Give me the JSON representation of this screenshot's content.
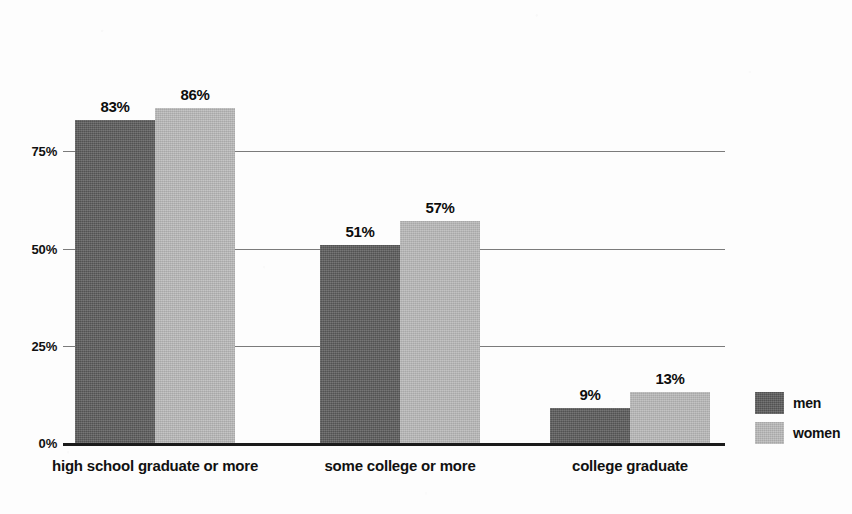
{
  "chart_data": {
    "type": "bar",
    "title": "",
    "subtitle": "",
    "xlabel": "",
    "ylabel": "",
    "ylim": [
      0,
      100
    ],
    "yticks": [
      "0%",
      "25%",
      "50%",
      "75%"
    ],
    "ytick_values": [
      0,
      25,
      50,
      75
    ],
    "grid": true,
    "legend_position": "right",
    "categories": [
      "high school graduate or more",
      "some college or more",
      "college graduate"
    ],
    "series": [
      {
        "name": "men",
        "color": "#595959",
        "values": [
          83,
          51,
          9
        ],
        "labels": [
          "83%",
          "51%",
          "9%"
        ]
      },
      {
        "name": "women",
        "color": "#b8b8b8",
        "values": [
          86,
          57,
          13
        ],
        "labels": [
          "86%",
          "57%",
          "13%"
        ]
      }
    ]
  },
  "legend": {
    "items": [
      {
        "label": "men",
        "color": "#595959"
      },
      {
        "label": "women",
        "color": "#b8b8b8"
      }
    ]
  },
  "colors": {
    "men": "#595959",
    "women": "#b8b8b8",
    "gridline": "#7b7b7b",
    "baseline": "#1b1b1b",
    "text": "#111111",
    "background": "#fdfdfd"
  }
}
